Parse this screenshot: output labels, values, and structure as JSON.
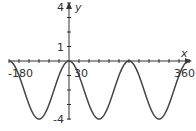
{
  "chart_data": {
    "type": "line",
    "title": "",
    "xlabel": "x",
    "ylabel": "y",
    "function": "y = -4 sin^2(x) (equivalently 2cos(2x) - 2)",
    "xlim": [
      -180,
      360
    ],
    "ylim": [
      -4,
      4
    ],
    "x_tick_step": 30,
    "y_tick_step": 1,
    "x_tick_labels": [
      "-180",
      "30",
      "360"
    ],
    "y_tick_labels": [
      "4",
      "1",
      "-4"
    ],
    "grid": false,
    "legend": null,
    "series": [
      {
        "name": "curve",
        "x": [
          -180,
          -135,
          -90,
          -45,
          0,
          45,
          90,
          135,
          180,
          225,
          270,
          315,
          360
        ],
        "values": [
          0,
          -2,
          -4,
          -2,
          0,
          -2,
          -4,
          -2,
          0,
          -2,
          -4,
          -2,
          0
        ]
      }
    ],
    "key_points": {
      "maxima": [
        [
          -180,
          0
        ],
        [
          0,
          0
        ],
        [
          180,
          0
        ],
        [
          360,
          0
        ]
      ],
      "minima": [
        [
          -90,
          -4
        ],
        [
          90,
          -4
        ],
        [
          270,
          -4
        ]
      ]
    }
  },
  "labels": {
    "x_axis": "x",
    "y_axis": "y",
    "x_min": "-180",
    "x_tick": "30",
    "x_max": "360",
    "y_max": "4",
    "y_tick": "1",
    "y_min": "-4"
  }
}
